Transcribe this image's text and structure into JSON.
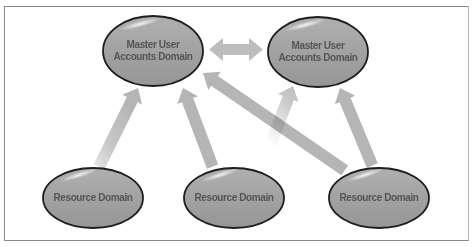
{
  "diagram": {
    "colors": {
      "node_fill": "#a3a3a3",
      "node_stroke": "#1e1e1e",
      "node_text": "#555555",
      "arrow": "#b8b8b8",
      "frame": "#8a8a8a"
    },
    "nodes": [
      {
        "id": "master1",
        "type": "master",
        "label_line1": "Master User",
        "label_line2": "Accounts Domain",
        "cx": 153,
        "cy": 51
      },
      {
        "id": "master2",
        "type": "master",
        "label_line1": "Master User",
        "label_line2": "Accounts Domain",
        "cx": 318,
        "cy": 52
      },
      {
        "id": "res1",
        "type": "resource",
        "label": "Resource Domain",
        "cx": 93,
        "cy": 198
      },
      {
        "id": "res2",
        "type": "resource",
        "label": "Resource Domain",
        "cx": 234,
        "cy": 198
      },
      {
        "id": "res3",
        "type": "resource",
        "label": "Resource Domain",
        "cx": 379,
        "cy": 198
      }
    ],
    "edges": [
      {
        "from": "res1",
        "to": "master1",
        "direction": "one-way"
      },
      {
        "from": "res1",
        "to": "master2",
        "direction": "one-way"
      },
      {
        "from": "res2",
        "to": "master1",
        "direction": "one-way"
      },
      {
        "from": "res2",
        "to": "master2",
        "direction": "one-way"
      },
      {
        "from": "res3",
        "to": "master1",
        "direction": "one-way"
      },
      {
        "from": "res3",
        "to": "master2",
        "direction": "one-way"
      },
      {
        "from": "master1",
        "to": "master2",
        "direction": "two-way"
      }
    ]
  }
}
